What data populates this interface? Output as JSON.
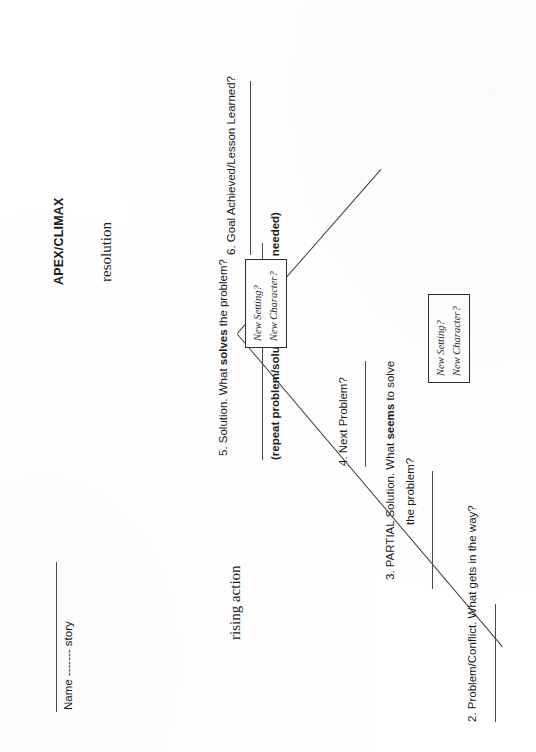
{
  "document": {
    "type": "story-arc-worksheet",
    "orientation": "rotated-90-ccw",
    "ink_color": "#1b1b1b",
    "rule_color": "#4a4a4a"
  },
  "header": {
    "name_line_label": "Name ------- story"
  },
  "arc_labels": {
    "apex": "APEX/CLIMAX",
    "rising_action": "rising action",
    "resolution": "resolution"
  },
  "steps": [
    {
      "id": "step-2",
      "number": "2.",
      "text": "2. Problem/Conflict. What gets in the way?",
      "bold_word": ""
    },
    {
      "id": "step-3",
      "number": "3.",
      "line1": "3. PARTIAL Solution. What seems to solve",
      "line2": "the problem?",
      "bold_word": "seems"
    },
    {
      "id": "step-4",
      "number": "4.",
      "text": "4. Next Problem?",
      "bold_word": ""
    },
    {
      "id": "step-5",
      "number": "5.",
      "text": "5. Solution. What solves the problem?",
      "bold_word": "solves"
    },
    {
      "id": "step-6",
      "number": "6.",
      "text": "6. Goal Achieved/Lesson Learned?",
      "bold_word": ""
    }
  ],
  "step_text": {
    "s2": "2. Problem/Conflict. What gets in the way?",
    "s3_a": "3. PARTIAL Solution. What ",
    "s3_bold": "seems",
    "s3_b": " to solve",
    "s3_line2": "the problem?",
    "s4": "4. Next Problem?",
    "s5_a": "5. Solution. What ",
    "s5_bold": "solves",
    "s5_b": " the problem?",
    "s6": "6. Goal Achieved/Lesson Learned?"
  },
  "note": {
    "repeat_text": "(repeat problem/solution dynamic as needed)"
  },
  "tag_boxes": [
    {
      "id": "tag-box-lower",
      "line1": "New Setting?",
      "line2": "New Character?"
    },
    {
      "id": "tag-box-upper",
      "line1": "New Setting?",
      "line2": "New Character?"
    }
  ],
  "tags": {
    "box1_line1": "New Setting?",
    "box1_line2": "New Character?",
    "box2_line1": "New Setting?",
    "box2_line2": "New Character?"
  }
}
